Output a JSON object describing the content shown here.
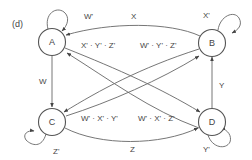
{
  "panel_label": "(d)",
  "colors": {
    "stroke": "#555555",
    "text": "#444444",
    "background": "#ffffff"
  },
  "nodes": [
    {
      "id": "A",
      "label": "A",
      "cx": 52,
      "cy": 42
    },
    {
      "id": "B",
      "label": "B",
      "cx": 212,
      "cy": 42
    },
    {
      "id": "C",
      "label": "C",
      "cx": 52,
      "cy": 122
    },
    {
      "id": "D",
      "label": "D",
      "cx": 212,
      "cy": 122
    }
  ],
  "edges": [
    {
      "from": "A",
      "to": "A",
      "label": "W'"
    },
    {
      "from": "B",
      "to": "B",
      "label": "X'"
    },
    {
      "from": "C",
      "to": "C",
      "label": "Z'"
    },
    {
      "from": "D",
      "to": "D",
      "label": "Y'"
    },
    {
      "from": "B",
      "to": "A",
      "label": "X"
    },
    {
      "from": "A",
      "to": "C",
      "label": "W"
    },
    {
      "from": "D",
      "to": "B",
      "label": "Y"
    },
    {
      "from": "C",
      "to": "D",
      "label": "Z"
    },
    {
      "from": "A",
      "to": "D",
      "label": "X' · Y' · Z'"
    },
    {
      "from": "B",
      "to": "C",
      "label": "W' · Y' · Z'"
    },
    {
      "from": "C",
      "to": "B",
      "label": "W' · X' · Y'"
    },
    {
      "from": "D",
      "to": "A",
      "label": "W' · X' · Z'"
    }
  ]
}
